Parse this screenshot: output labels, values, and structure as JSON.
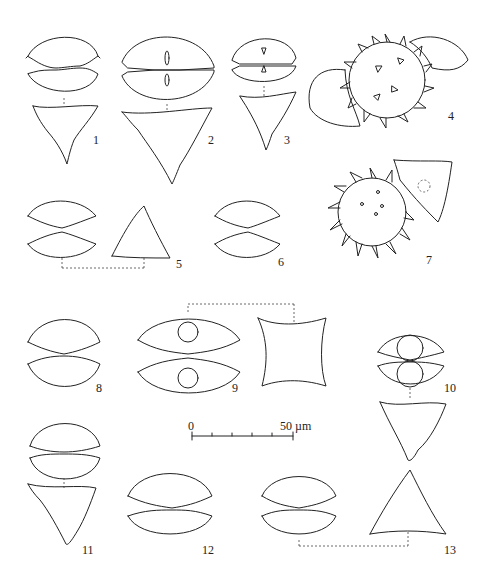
{
  "figure": {
    "type": "taxonomic illustration plate",
    "background": "#ffffff",
    "line_color": "#222222"
  },
  "specimens": [
    {
      "id": "1",
      "label": "1",
      "views": [
        "front",
        "apical"
      ]
    },
    {
      "id": "2",
      "label": "2",
      "views": [
        "front",
        "apical"
      ]
    },
    {
      "id": "3",
      "label": "3",
      "views": [
        "front",
        "apical"
      ]
    },
    {
      "id": "4",
      "label": "4",
      "views": [
        "zygospore with semicells"
      ]
    },
    {
      "id": "5",
      "label": "5",
      "views": [
        "front",
        "apical"
      ]
    },
    {
      "id": "6",
      "label": "6",
      "views": [
        "front"
      ]
    },
    {
      "id": "7",
      "label": "7",
      "views": [
        "zygospore with semicell"
      ]
    },
    {
      "id": "8",
      "label": "8",
      "views": [
        "front"
      ]
    },
    {
      "id": "9",
      "label": "9",
      "views": [
        "front",
        "apical"
      ]
    },
    {
      "id": "10",
      "label": "10",
      "views": [
        "front",
        "apical"
      ]
    },
    {
      "id": "11",
      "label": "11",
      "views": [
        "front",
        "apical"
      ]
    },
    {
      "id": "12",
      "label": "12",
      "views": [
        "front"
      ]
    },
    {
      "id": "13",
      "label": "13",
      "views": [
        "front",
        "apical"
      ]
    }
  ],
  "scale_bar": {
    "start_label": "0",
    "end_label": "50 µm",
    "ticks": 6
  }
}
